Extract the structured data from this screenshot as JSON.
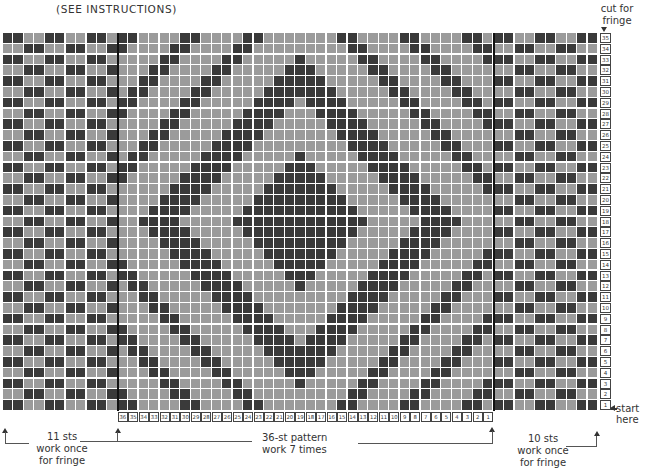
{
  "header": {
    "title": "(SEE INSTRUCTIONS)",
    "cut_note": "cut for fringe"
  },
  "colors": {
    "dark": "#3a3a3a",
    "light": "#9b9b9b",
    "grid_line": "#ffffff",
    "divider": "#111111"
  },
  "chart": {
    "rows": 35,
    "left_fringe_cols": 11,
    "pattern_cols": 36,
    "right_fringe_cols": 10,
    "pattern_dark_cells_by_row": {
      "35": [
        0,
        1,
        6,
        7,
        12,
        13,
        21,
        22,
        27,
        28,
        33,
        34
      ],
      "34": [
        0,
        5,
        6,
        11,
        12,
        22,
        23,
        28,
        29,
        34,
        35
      ],
      "33": [
        4,
        5,
        10,
        11,
        17,
        23,
        24,
        29,
        30,
        35
      ],
      "32": [
        3,
        4,
        9,
        10,
        16,
        17,
        18,
        24,
        25,
        30,
        31
      ],
      "31": [
        2,
        3,
        8,
        9,
        15,
        16,
        17,
        18,
        19,
        25,
        26,
        31,
        32
      ],
      "30": [
        1,
        2,
        7,
        8,
        14,
        15,
        16,
        17,
        18,
        19,
        20,
        26,
        27,
        32,
        33
      ],
      "29": [
        0,
        1,
        6,
        7,
        13,
        14,
        15,
        16,
        18,
        19,
        20,
        21,
        27,
        28,
        33,
        34
      ],
      "28": [
        0,
        5,
        6,
        12,
        13,
        14,
        15,
        19,
        20,
        21,
        22,
        28,
        29,
        34,
        35
      ],
      "27": [
        4,
        5,
        11,
        12,
        13,
        14,
        20,
        21,
        22,
        23,
        29,
        30,
        35
      ],
      "26": [
        3,
        4,
        10,
        11,
        12,
        13,
        21,
        22,
        23,
        24,
        30,
        31
      ],
      "25": [
        2,
        3,
        9,
        10,
        11,
        12,
        22,
        23,
        24,
        25,
        31,
        32
      ],
      "24": [
        1,
        2,
        8,
        9,
        10,
        11,
        17,
        23,
        24,
        25,
        26,
        32,
        33
      ],
      "23": [
        0,
        1,
        7,
        8,
        9,
        10,
        16,
        17,
        18,
        24,
        25,
        26,
        27,
        33,
        34
      ],
      "22": [
        0,
        6,
        7,
        8,
        9,
        15,
        16,
        17,
        18,
        19,
        25,
        26,
        27,
        28,
        34,
        35
      ],
      "21": [
        5,
        6,
        7,
        8,
        14,
        15,
        16,
        17,
        18,
        19,
        20,
        26,
        27,
        28,
        29,
        35
      ],
      "20": [
        4,
        5,
        6,
        7,
        13,
        14,
        15,
        16,
        17,
        18,
        19,
        20,
        21,
        27,
        28,
        29,
        30
      ],
      "19": [
        3,
        4,
        5,
        6,
        12,
        13,
        14,
        15,
        16,
        17,
        18,
        19,
        20,
        21,
        22,
        28,
        29,
        30,
        31
      ],
      "18": [
        2,
        3,
        4,
        5,
        11,
        12,
        13,
        14,
        15,
        16,
        17,
        18,
        19,
        20,
        21,
        22,
        23,
        29,
        30,
        31,
        32
      ],
      "17": [
        3,
        4,
        5,
        6,
        12,
        13,
        14,
        15,
        16,
        17,
        18,
        19,
        20,
        21,
        22,
        28,
        29,
        30,
        31
      ],
      "16": [
        4,
        5,
        6,
        7,
        13,
        14,
        15,
        16,
        17,
        18,
        19,
        20,
        21,
        27,
        28,
        29,
        30
      ],
      "15": [
        5,
        6,
        7,
        8,
        14,
        15,
        16,
        17,
        18,
        19,
        20,
        26,
        27,
        28,
        29,
        35
      ],
      "14": [
        0,
        6,
        7,
        8,
        9,
        15,
        16,
        17,
        18,
        19,
        25,
        26,
        27,
        28,
        34,
        35
      ],
      "13": [
        0,
        1,
        7,
        8,
        9,
        10,
        16,
        17,
        18,
        24,
        25,
        26,
        27,
        33,
        34
      ],
      "12": [
        1,
        2,
        8,
        9,
        10,
        11,
        17,
        23,
        24,
        25,
        26,
        32,
        33
      ],
      "11": [
        2,
        3,
        9,
        10,
        11,
        12,
        22,
        23,
        24,
        25,
        31,
        32
      ],
      "10": [
        3,
        4,
        10,
        11,
        12,
        13,
        21,
        22,
        23,
        24,
        30,
        31
      ],
      "9": [
        4,
        5,
        11,
        12,
        13,
        14,
        20,
        21,
        22,
        23,
        29,
        30,
        35
      ],
      "8": [
        0,
        5,
        6,
        12,
        13,
        14,
        15,
        19,
        20,
        21,
        22,
        28,
        29,
        34,
        35
      ],
      "7": [
        0,
        1,
        6,
        7,
        13,
        14,
        15,
        16,
        18,
        19,
        20,
        21,
        27,
        28,
        33,
        34
      ],
      "6": [
        1,
        2,
        7,
        8,
        14,
        15,
        16,
        17,
        18,
        19,
        20,
        26,
        27,
        32,
        33
      ],
      "5": [
        2,
        3,
        8,
        9,
        15,
        16,
        17,
        18,
        19,
        25,
        26,
        31,
        32
      ],
      "4": [
        3,
        4,
        9,
        10,
        16,
        17,
        18,
        24,
        25,
        30,
        31
      ],
      "3": [
        4,
        5,
        10,
        11,
        17,
        23,
        24,
        29,
        30,
        35
      ],
      "2": [
        0,
        5,
        6,
        11,
        12,
        22,
        23,
        28,
        29,
        34,
        35
      ],
      "1": [
        0,
        1,
        6,
        7,
        12,
        13,
        21,
        22,
        27,
        28,
        33,
        34
      ]
    },
    "fringe_dark_odd_rows": [
      0,
      1,
      4,
      5,
      8,
      9
    ],
    "fringe_dark_even_rows": [
      2,
      3,
      6,
      7,
      10
    ],
    "row_numbers": [
      "35",
      "34",
      "33",
      "32",
      "31",
      "30",
      "29",
      "28",
      "27",
      "26",
      "25",
      "24",
      "23",
      "22",
      "21",
      "20",
      "19",
      "18",
      "17",
      "16",
      "15",
      "14",
      "13",
      "12",
      "11",
      "10",
      "9",
      "8",
      "7",
      "6",
      "5",
      "4",
      "3",
      "2",
      "1"
    ],
    "column_numbers": [
      "36",
      "35",
      "34",
      "33",
      "32",
      "31",
      "30",
      "29",
      "28",
      "27",
      "26",
      "25",
      "24",
      "23",
      "22",
      "21",
      "20",
      "19",
      "18",
      "17",
      "16",
      "15",
      "14",
      "13",
      "12",
      "11",
      "10",
      "9",
      "8",
      "7",
      "6",
      "5",
      "4",
      "3",
      "2",
      "1"
    ]
  },
  "annotations": {
    "start": "start here",
    "left_fringe": {
      "line1": "11 sts",
      "line2": "work once",
      "line3": "for fringe"
    },
    "pattern": {
      "line1": "36-st pattern",
      "line2": "work 7 times"
    },
    "right_fringe": {
      "line1": "10 sts",
      "line2": "work once",
      "line3": "for fringe"
    }
  }
}
